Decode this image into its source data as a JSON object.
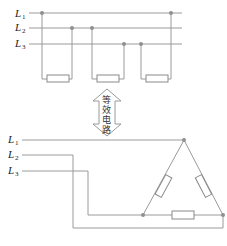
{
  "top_circuit": {
    "lines": [
      {
        "label": "L",
        "sub": "1"
      },
      {
        "label": "L",
        "sub": "2"
      },
      {
        "label": "L",
        "sub": "3"
      }
    ]
  },
  "equivalence_arrow": {
    "text": [
      "等",
      "效",
      "电",
      "路"
    ]
  },
  "bottom_circuit": {
    "lines": [
      {
        "label": "L",
        "sub": "1"
      },
      {
        "label": "L",
        "sub": "2"
      },
      {
        "label": "L",
        "sub": "3"
      }
    ]
  },
  "colors": {
    "wire": "#9a9a9a",
    "node": "#8f8f8f"
  }
}
